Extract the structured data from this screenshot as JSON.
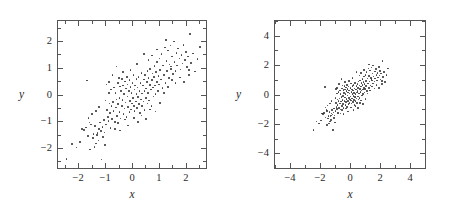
{
  "figure": {
    "background": "#ffffff",
    "point_color": "#3a3a3a",
    "axis_color": "#555555"
  },
  "chart_data": [
    {
      "type": "scatter",
      "title": "",
      "xlabel": "x",
      "ylabel": "y",
      "xlim": [
        -2.75,
        2.75
      ],
      "ylim": [
        -2.75,
        2.75
      ],
      "xticks": [
        -2,
        -1,
        0,
        1,
        2
      ],
      "yticks": [
        -2,
        -1,
        0,
        1,
        2
      ],
      "xticklabels": [
        "−2",
        "−1",
        "0",
        "1",
        "2"
      ],
      "yticklabels": [
        "−2",
        "−1",
        "0",
        "1",
        "2"
      ],
      "minor_tick_step": 0.5,
      "grid": false,
      "legend": null,
      "n_points": 200,
      "correlation": 0.75,
      "points": [
        [
          -2.44,
          -2.42
        ],
        [
          -2.23,
          -1.85
        ],
        [
          -1.93,
          -1.78
        ],
        [
          -1.86,
          -1.28
        ],
        [
          -1.79,
          -1.33
        ],
        [
          -1.72,
          -1.24
        ],
        [
          -1.68,
          0.52
        ],
        [
          -1.62,
          -0.88
        ],
        [
          -1.58,
          -1.05
        ],
        [
          -1.55,
          -2.06
        ],
        [
          -1.52,
          -1.13
        ],
        [
          -1.49,
          -0.74
        ],
        [
          -1.46,
          -1.62
        ],
        [
          -1.43,
          -1.48
        ],
        [
          -1.4,
          -1.96
        ],
        [
          -1.37,
          -1.18
        ],
        [
          -1.34,
          -0.62
        ],
        [
          -1.31,
          -1.51
        ],
        [
          -1.28,
          -1.44
        ],
        [
          -1.25,
          -1.72
        ],
        [
          -1.22,
          -1.3
        ],
        [
          -1.19,
          -1.05
        ],
        [
          -1.16,
          -1.36
        ],
        [
          -1.13,
          -2.43
        ],
        [
          -1.1,
          -1.22
        ],
        [
          -1.07,
          -1.58
        ],
        [
          -1.05,
          -0.96
        ],
        [
          -1.02,
          -1.42
        ],
        [
          -1.0,
          -1.9
        ],
        [
          -0.98,
          -0.22
        ],
        [
          -0.96,
          -1.12
        ],
        [
          -0.94,
          0.38
        ],
        [
          -0.92,
          -0.58
        ],
        [
          -0.9,
          -0.85
        ],
        [
          -0.88,
          -1.0
        ],
        [
          -0.86,
          0.46
        ],
        [
          -0.84,
          -0.34
        ],
        [
          -0.82,
          -0.7
        ],
        [
          -0.8,
          -1.25
        ],
        [
          -0.78,
          0.18
        ],
        [
          -0.76,
          -0.44
        ],
        [
          -0.74,
          -0.92
        ],
        [
          -0.72,
          0.72
        ],
        [
          -0.7,
          -0.28
        ],
        [
          -0.68,
          -0.62
        ],
        [
          -0.66,
          0.26
        ],
        [
          -0.64,
          -1.02
        ],
        [
          -0.62,
          0.05
        ],
        [
          -0.6,
          -0.48
        ],
        [
          -0.58,
          1.04
        ],
        [
          -0.57,
          -0.18
        ],
        [
          -0.55,
          -0.8
        ],
        [
          -0.53,
          0.42
        ],
        [
          -0.51,
          -0.36
        ],
        [
          -0.49,
          0.62
        ],
        [
          -0.47,
          -0.12
        ],
        [
          -0.46,
          -0.66
        ],
        [
          -0.44,
          0.3
        ],
        [
          -0.42,
          -0.9
        ],
        [
          -0.4,
          0.12
        ],
        [
          -0.38,
          -0.44
        ],
        [
          -0.37,
          0.58
        ],
        [
          -0.35,
          -0.2
        ],
        [
          -0.33,
          0.34
        ],
        [
          -0.31,
          -0.72
        ],
        [
          -0.3,
          0.02
        ],
        [
          -0.28,
          -0.52
        ],
        [
          -0.26,
          0.48
        ],
        [
          -0.24,
          -0.3
        ],
        [
          -0.23,
          0.22
        ],
        [
          -0.21,
          -0.84
        ],
        [
          -0.19,
          0.66
        ],
        [
          -0.17,
          -0.08
        ],
        [
          -0.16,
          0.38
        ],
        [
          -0.14,
          -0.46
        ],
        [
          -0.12,
          0.14
        ],
        [
          -0.1,
          -0.66
        ],
        [
          -0.09,
          0.54
        ],
        [
          -0.07,
          -0.24
        ],
        [
          -0.05,
          0.28
        ],
        [
          -0.03,
          -0.56
        ],
        [
          -0.02,
          0.06
        ],
        [
          0.0,
          -0.34
        ],
        [
          0.02,
          0.44
        ],
        [
          0.03,
          -0.14
        ],
        [
          0.05,
          0.74
        ],
        [
          0.07,
          -0.42
        ],
        [
          0.09,
          0.18
        ],
        [
          0.1,
          -0.62
        ],
        [
          0.12,
          0.34
        ],
        [
          0.14,
          -0.26
        ],
        [
          0.16,
          0.58
        ],
        [
          0.17,
          0.02
        ],
        [
          0.19,
          -0.5
        ],
        [
          0.21,
          0.26
        ],
        [
          0.23,
          -0.1
        ],
        [
          0.24,
          0.66
        ],
        [
          0.26,
          -0.36
        ],
        [
          0.28,
          0.12
        ],
        [
          0.3,
          -0.7
        ],
        [
          0.31,
          0.42
        ],
        [
          0.33,
          -0.18
        ],
        [
          0.35,
          0.8
        ],
        [
          0.37,
          0.04
        ],
        [
          0.38,
          -0.44
        ],
        [
          0.4,
          0.34
        ],
        [
          0.42,
          -0.26
        ],
        [
          0.44,
          0.56
        ],
        [
          0.46,
          0.14
        ],
        [
          0.47,
          -0.58
        ],
        [
          0.49,
          0.72
        ],
        [
          0.51,
          0.22
        ],
        [
          0.53,
          -0.14
        ],
        [
          0.55,
          0.46
        ],
        [
          0.57,
          -0.34
        ],
        [
          0.58,
          0.88
        ],
        [
          0.6,
          0.06
        ],
        [
          0.62,
          0.62
        ],
        [
          0.64,
          -0.22
        ],
        [
          0.66,
          0.36
        ],
        [
          0.68,
          0.96
        ],
        [
          0.7,
          0.18
        ],
        [
          0.72,
          -0.42
        ],
        [
          0.74,
          0.54
        ],
        [
          0.76,
          0.78
        ],
        [
          0.78,
          0.26
        ],
        [
          0.8,
          -0.08
        ],
        [
          0.82,
          0.66
        ],
        [
          0.84,
          1.06
        ],
        [
          0.86,
          0.34
        ],
        [
          0.88,
          0.02
        ],
        [
          0.9,
          0.84
        ],
        [
          0.92,
          0.46
        ],
        [
          0.94,
          1.22
        ],
        [
          0.96,
          0.14
        ],
        [
          0.98,
          0.7
        ],
        [
          1.0,
          0.38
        ],
        [
          1.02,
          1.34
        ],
        [
          1.05,
          0.92
        ],
        [
          1.07,
          0.56
        ],
        [
          1.1,
          1.52
        ],
        [
          1.13,
          0.24
        ],
        [
          1.16,
          1.08
        ],
        [
          1.19,
          0.74
        ],
        [
          1.22,
          1.76
        ],
        [
          1.25,
          0.44
        ],
        [
          1.28,
          1.26
        ],
        [
          1.31,
          0.88
        ],
        [
          1.34,
          1.64
        ],
        [
          1.37,
          0.62
        ],
        [
          1.4,
          1.12
        ],
        [
          1.43,
          1.84
        ],
        [
          1.46,
          0.96
        ],
        [
          1.49,
          1.42
        ],
        [
          1.52,
          0.76
        ],
        [
          1.55,
          1.98
        ],
        [
          1.58,
          1.22
        ],
        [
          1.62,
          0.88
        ],
        [
          1.65,
          1.56
        ],
        [
          1.68,
          1.08
        ],
        [
          1.72,
          1.72
        ],
        [
          1.76,
          1.34
        ],
        [
          1.8,
          0.94
        ],
        [
          1.84,
          1.48
        ],
        [
          1.88,
          1.16
        ],
        [
          1.92,
          1.86
        ],
        [
          1.96,
          1.28
        ],
        [
          2.0,
          1.6
        ],
        [
          2.04,
          1.02
        ],
        [
          2.08,
          1.42
        ],
        [
          2.12,
          0.72
        ],
        [
          2.16,
          2.26
        ],
        [
          2.2,
          1.18
        ],
        [
          2.26,
          1.54
        ],
        [
          2.34,
          0.86
        ],
        [
          2.44,
          1.32
        ],
        [
          2.52,
          1.78
        ],
        [
          -2.06,
          -1.98
        ],
        [
          -1.64,
          -1.56
        ],
        [
          -1.34,
          -1.84
        ],
        [
          -0.64,
          -1.28
        ],
        [
          -0.52,
          -1.06
        ],
        [
          -0.44,
          -1.34
        ],
        [
          -0.26,
          -0.94
        ],
        [
          -0.14,
          -1.16
        ],
        [
          0.08,
          -0.88
        ],
        [
          0.22,
          -1.04
        ],
        [
          0.36,
          -0.78
        ],
        [
          0.52,
          -0.92
        ],
        [
          0.66,
          -0.56
        ],
        [
          0.88,
          -0.64
        ],
        [
          1.04,
          -0.32
        ],
        [
          1.18,
          0.06
        ],
        [
          1.34,
          0.28
        ],
        [
          1.48,
          0.54
        ],
        [
          1.62,
          0.42
        ],
        [
          1.78,
          0.64
        ],
        [
          1.94,
          0.46
        ],
        [
          2.12,
          0.92
        ],
        [
          0.44,
          1.52
        ],
        [
          0.18,
          1.14
        ],
        [
          -0.06,
          0.92
        ],
        [
          0.62,
          1.28
        ],
        [
          0.94,
          1.68
        ],
        [
          1.26,
          2.04
        ],
        [
          -0.34,
          0.84
        ],
        [
          -0.86,
          0.06
        ],
        [
          -1.22,
          -0.46
        ],
        [
          0.74,
          1.46
        ],
        [
          1.44,
          1.04
        ]
      ]
    },
    {
      "type": "scatter",
      "title": "",
      "xlabel": "x",
      "ylabel": "y",
      "xlim": [
        -5.0,
        5.0
      ],
      "ylim": [
        -5.0,
        5.0
      ],
      "xticks": [
        -4,
        -2,
        0,
        2,
        4
      ],
      "yticks": [
        -4,
        -2,
        0,
        2,
        4
      ],
      "xticklabels": [
        "−4",
        "−2",
        "0",
        "2",
        "4"
      ],
      "yticklabels": [
        "−4",
        "−2",
        "0",
        "2",
        "4"
      ],
      "minor_tick_step": 1.0,
      "grid": false,
      "legend": null,
      "n_points": 200,
      "correlation": 0.75,
      "same_data_as_panel": 0
    }
  ]
}
